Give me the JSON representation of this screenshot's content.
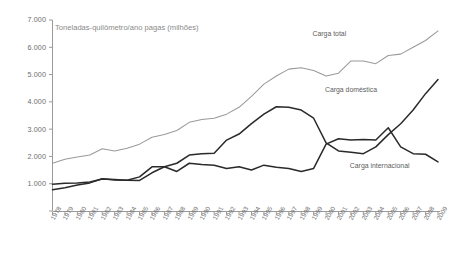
{
  "chart_data": {
    "type": "line",
    "title": "Toneladas-quilômetro/ano pagas (milhões)",
    "xlabel": "",
    "ylabel": "",
    "ylim": [
      0,
      7000
    ],
    "grid": false,
    "legend_position": "inline-annotations",
    "ytick_labels": [
      "7.000",
      "6.000",
      "5.000",
      "4.000",
      "3.000",
      "2.000",
      "1.000"
    ],
    "ytick_values": [
      7000,
      6000,
      5000,
      4000,
      3000,
      2000,
      1000
    ],
    "x": [
      1978,
      1979,
      1980,
      1981,
      1982,
      1983,
      1984,
      1985,
      1986,
      1987,
      1988,
      1989,
      1990,
      1991,
      1992,
      1993,
      1994,
      1995,
      1996,
      1997,
      1998,
      1999,
      2000,
      2001,
      2002,
      2003,
      2004,
      2005,
      2006,
      2007,
      2008,
      2009
    ],
    "xtick_labels": [
      "1978",
      "1979",
      "1980",
      "1981",
      "1982",
      "1983",
      "1984",
      "1985",
      "1986",
      "1987",
      "1988",
      "1989",
      "1990",
      "1991",
      "1992",
      "1993",
      "1994",
      "1995",
      "1996",
      "1997",
      "1998",
      "1999",
      "2000",
      "2001",
      "2002",
      "2003",
      "2004",
      "2005",
      "2006",
      "2007",
      "2008",
      "2009"
    ],
    "series": [
      {
        "name": "Carga total",
        "color": "#9a9a9a",
        "values": [
          1750,
          1900,
          1980,
          2050,
          2280,
          2200,
          2300,
          2450,
          2700,
          2800,
          2950,
          3250,
          3350,
          3400,
          3550,
          3800,
          4200,
          4650,
          4950,
          5200,
          5250,
          5150,
          4950,
          5050,
          5500,
          5500,
          5400,
          5700,
          5750,
          6000,
          6250,
          6600
        ]
      },
      {
        "name": "Carga doméstica",
        "color": "#2a2a2a",
        "values": [
          980,
          1020,
          1030,
          1060,
          1170,
          1150,
          1130,
          1250,
          1620,
          1620,
          1450,
          1750,
          1700,
          1680,
          1560,
          1620,
          1500,
          1680,
          1600,
          1560,
          1450,
          1560,
          2450,
          2650,
          2600,
          2620,
          2600,
          3050,
          2350,
          2100,
          2080,
          1800
        ]
      },
      {
        "name": "Carga internacional",
        "color": "#2a2a2a",
        "values": [
          780,
          850,
          950,
          1030,
          1180,
          1140,
          1130,
          1120,
          1400,
          1620,
          1750,
          2050,
          2100,
          2120,
          2600,
          2820,
          3200,
          3550,
          3820,
          3800,
          3700,
          3400,
          2500,
          2200,
          2150,
          2100,
          2350,
          2800,
          3200,
          3700,
          4300,
          4820
        ]
      }
    ],
    "annotations": [
      {
        "text": "Carga total",
        "x": 2001,
        "y": 6450
      },
      {
        "text": "Carga doméstica",
        "x": 2002,
        "y": 4400
      },
      {
        "text": "Carga internacional",
        "x": 2004,
        "y": 1600
      }
    ]
  }
}
